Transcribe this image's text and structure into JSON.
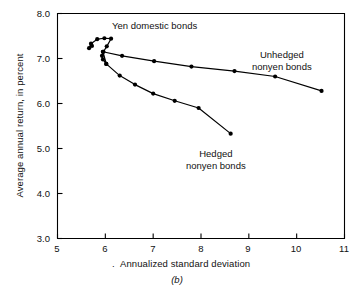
{
  "figure": {
    "panel_id": "(b)",
    "background": "#ffffff",
    "line_color": "#000000"
  },
  "chart_data": {
    "type": "scatter",
    "title": "",
    "xlabel": "Annualized standard deviation",
    "ylabel": "Average annual return, in percent",
    "xlim": [
      5,
      11
    ],
    "ylim": [
      3.0,
      8.0
    ],
    "xticks": [
      5,
      6,
      7,
      8,
      9,
      10,
      11
    ],
    "xtick_labels": [
      "5",
      "6",
      "7",
      "8",
      "9",
      "10",
      "11"
    ],
    "yticks": [
      3.0,
      4.0,
      5.0,
      6.0,
      7.0,
      8.0
    ],
    "ytick_labels": [
      "3.0",
      "4.0",
      "5.0",
      "6.0",
      "7.0",
      "8.0"
    ],
    "grid": false,
    "legend": "annotations",
    "marker": "filled-circle",
    "series": [
      {
        "name": "Yen domestic bonds",
        "label_position": "top-center",
        "points": [
          [
            5.72,
            7.28
          ],
          [
            5.66,
            7.23
          ],
          [
            5.7,
            7.33
          ],
          [
            5.83,
            7.43
          ],
          [
            5.98,
            7.45
          ],
          [
            6.12,
            7.44
          ],
          [
            6.03,
            7.27
          ],
          [
            5.96,
            7.15
          ],
          [
            5.93,
            7.06
          ],
          [
            5.95,
            6.98
          ],
          [
            6.02,
            6.88
          ]
        ]
      },
      {
        "name": "Unhedged nonyen bonds",
        "label_position": "right-upper",
        "points": [
          [
            5.95,
            7.15
          ],
          [
            6.35,
            7.06
          ],
          [
            7.02,
            6.94
          ],
          [
            7.8,
            6.82
          ],
          [
            8.7,
            6.72
          ],
          [
            9.55,
            6.6
          ],
          [
            10.52,
            6.28
          ]
        ]
      },
      {
        "name": "Hedged nonyen bonds",
        "label_position": "bottom-right",
        "points": [
          [
            5.95,
            7.15
          ],
          [
            6.02,
            6.88
          ],
          [
            6.3,
            6.62
          ],
          [
            6.62,
            6.42
          ],
          [
            7.0,
            6.22
          ],
          [
            7.45,
            6.06
          ],
          [
            7.95,
            5.9
          ],
          [
            8.62,
            5.33
          ]
        ]
      }
    ],
    "annotations": [
      {
        "text": "Yen domestic bonds",
        "x": 6.5,
        "y": 7.85
      },
      {
        "text_line1": "Unhedged",
        "text_line2": "nonyen bonds",
        "x": 9.6,
        "y": 7.2
      },
      {
        "text_line1": "Hedged",
        "text_line2": "nonyen bonds",
        "x": 8.3,
        "y": 4.95
      }
    ]
  }
}
